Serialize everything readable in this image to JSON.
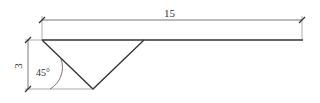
{
  "diagram": {
    "type": "engineering-drawing",
    "colors": {
      "line": "#333333",
      "thin": "#555555",
      "background": "#ffffff"
    },
    "dimensions": {
      "length": {
        "label": "15"
      },
      "depth": {
        "label": "3"
      },
      "angle": {
        "label": "45°"
      }
    }
  }
}
